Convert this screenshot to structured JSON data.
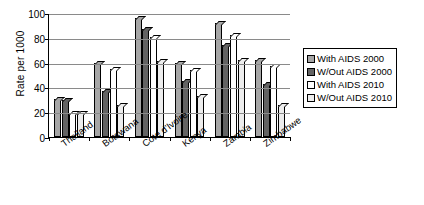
{
  "chart_data": {
    "type": "bar",
    "title": "",
    "xlabel": "",
    "ylabel": "Rate per 1000",
    "ylim": [
      0,
      100
    ],
    "yticks": [
      0,
      20,
      40,
      60,
      80,
      100
    ],
    "grid": true,
    "legend_position": "right",
    "categories": [
      "Thailand",
      "Botswana",
      "Cote d'Ivoire",
      "Kenya",
      "Zambia",
      "Zimbabwe"
    ],
    "series": [
      {
        "name": "With AIDS 2000",
        "color": "#a6a6a6",
        "values": [
          31,
          60,
          96,
          60,
          92,
          62
        ]
      },
      {
        "name": "W/Out AIDS 2000",
        "color": "#636363",
        "values": [
          30,
          37,
          87,
          45,
          74,
          43
        ]
      },
      {
        "name": "With AIDS 2010",
        "color": "#ffffff",
        "values": [
          19,
          55,
          81,
          54,
          82,
          57
        ]
      },
      {
        "name": "W/Out AIDS 2010",
        "color": "#ededed",
        "values": [
          19,
          26,
          61,
          33,
          62,
          26
        ]
      }
    ]
  },
  "legend": {
    "items": [
      {
        "label": "With AIDS 2000"
      },
      {
        "label": "W/Out AIDS 2000"
      },
      {
        "label": "With AIDS 2010"
      },
      {
        "label": "W/Out AIDS 2010"
      }
    ]
  }
}
